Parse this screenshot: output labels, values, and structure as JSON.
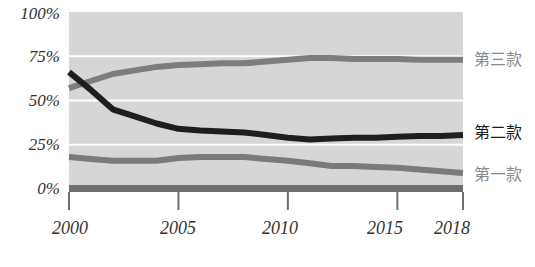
{
  "chart_data": {
    "type": "line",
    "title": "",
    "xlabel": "",
    "ylabel": "",
    "x": [
      2000,
      2001,
      2002,
      2003,
      2004,
      2005,
      2006,
      2007,
      2008,
      2009,
      2010,
      2011,
      2012,
      2013,
      2014,
      2015,
      2016,
      2017,
      2018
    ],
    "x_ticks": [
      "2000",
      "2005",
      "2010",
      "2015",
      "2018"
    ],
    "y_ticks": [
      "0%",
      "25%",
      "50%",
      "75%",
      "100%"
    ],
    "ylim": [
      0,
      100
    ],
    "xlim": [
      2000,
      2018
    ],
    "grid": "horizontal white gridlines at 25%, 50%, 75%",
    "background": "#d6d6d6",
    "legend_position": "right, inline labels at line ends",
    "series": [
      {
        "name": "第三款",
        "color": "#7d7d7d",
        "values": [
          57,
          61,
          65,
          67,
          69,
          70,
          70.5,
          71,
          71,
          72,
          73,
          74,
          74,
          73.5,
          73.5,
          73.5,
          73,
          73,
          73
        ]
      },
      {
        "name": "第二款",
        "color": "#1e1e1e",
        "values": [
          66,
          56,
          45,
          41,
          37,
          34,
          33,
          32.5,
          32,
          30.5,
          29,
          28,
          28.5,
          29,
          29,
          29.5,
          30,
          30,
          30.5
        ]
      },
      {
        "name": "第一款",
        "color": "#7a7a7a",
        "values": [
          18,
          17,
          16,
          16,
          16,
          17.5,
          18,
          18,
          18,
          17,
          16,
          14.5,
          13,
          13,
          12.5,
          12,
          11,
          10,
          9
        ]
      }
    ],
    "baseline_bar": {
      "value": 0,
      "color": "#6e6e6e"
    }
  },
  "legend": {
    "items": [
      {
        "label": "第三款",
        "color": "#8a8a8a"
      },
      {
        "label": "第二款",
        "color": "#1a1a1a"
      },
      {
        "label": "第一款",
        "color": "#8a8a8a"
      }
    ]
  },
  "axes": {
    "y_labels": [
      "100%",
      "75%",
      "50%",
      "25%",
      "0%"
    ],
    "x_labels": [
      "2000",
      "2005",
      "2010",
      "2015",
      "2018"
    ]
  }
}
